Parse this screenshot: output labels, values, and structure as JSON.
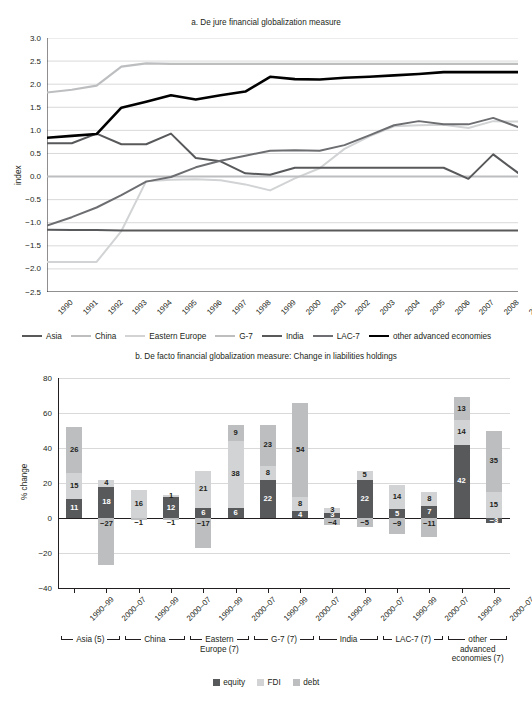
{
  "figure": {
    "panel_a_title": "a. De jure financial globalization measure",
    "panel_b_title": "b. De facto financial globalization measure: Change in liabilities holdings"
  },
  "chart_data": [
    {
      "type": "line",
      "title": "a. De jure financial globalization measure",
      "xlabel": "",
      "ylabel": "index",
      "ylim": [
        -2.5,
        3.0
      ],
      "yticks": [
        "-2.5",
        "-2.0",
        "-1.5",
        "-1.0",
        "-0.5",
        "0.0",
        "0.5",
        "1.0",
        "1.5",
        "2.0",
        "2.5",
        "3.0"
      ],
      "grid": true,
      "legend_position": "bottom",
      "x": [
        "1990",
        "1991",
        "1992",
        "1993",
        "1994",
        "1995",
        "1996",
        "1997",
        "1998",
        "1999",
        "2000",
        "2001",
        "2002",
        "2003",
        "2004",
        "2005",
        "2006",
        "2007",
        "2008",
        "2009"
      ],
      "series": [
        {
          "name": "Asia",
          "color": "#58595b",
          "width": 2.0,
          "values": [
            0.72,
            0.72,
            0.93,
            0.7,
            0.7,
            0.93,
            0.4,
            0.33,
            0.07,
            0.04,
            0.19,
            0.19,
            0.19,
            0.19,
            0.19,
            0.19,
            0.19,
            -0.05,
            0.48,
            0.08
          ]
        },
        {
          "name": "China",
          "color": "#bcbec0",
          "width": 2.0,
          "values": [
            0.0,
            0.0,
            0.0,
            0.0,
            0.0,
            0.0,
            0.0,
            0.0,
            0.0,
            0.0,
            0.0,
            0.0,
            0.0,
            0.0,
            0.0,
            0.0,
            0.0,
            0.0,
            0.0,
            0.0
          ]
        },
        {
          "name": "Eastern Europe",
          "color": "#d1d3d4",
          "width": 2.0,
          "values": [
            -1.85,
            -1.85,
            -1.85,
            -1.18,
            -0.1,
            -0.07,
            -0.06,
            -0.08,
            -0.17,
            -0.3,
            -0.04,
            0.18,
            0.6,
            0.87,
            1.09,
            1.11,
            1.12,
            1.05,
            1.2,
            1.19
          ]
        },
        {
          "name": "G-7",
          "color": "#bcbec0",
          "width": 2.2,
          "values": [
            1.82,
            1.88,
            1.97,
            2.38,
            2.45,
            2.44,
            2.44,
            2.44,
            2.44,
            2.44,
            2.44,
            2.44,
            2.44,
            2.44,
            2.44,
            2.44,
            2.44,
            2.44,
            2.44,
            2.44
          ]
        },
        {
          "name": "India",
          "color": "#58595b",
          "width": 2.0,
          "values": [
            -1.15,
            -1.16,
            -1.16,
            -1.17,
            -1.17,
            -1.17,
            -1.17,
            -1.17,
            -1.17,
            -1.17,
            -1.17,
            -1.17,
            -1.17,
            -1.17,
            -1.17,
            -1.17,
            -1.17,
            -1.17,
            -1.17,
            -1.17
          ]
        },
        {
          "name": "LAC-7",
          "color": "#6d6e71",
          "width": 2.0,
          "values": [
            -1.06,
            -0.88,
            -0.67,
            -0.4,
            -0.11,
            -0.01,
            0.2,
            0.34,
            0.45,
            0.56,
            0.57,
            0.56,
            0.68,
            0.89,
            1.11,
            1.2,
            1.13,
            1.13,
            1.27,
            1.07
          ]
        },
        {
          "name": "other advanced economies",
          "color": "#000000",
          "width": 2.6,
          "values": [
            0.84,
            0.88,
            0.92,
            1.49,
            1.62,
            1.76,
            1.67,
            1.76,
            1.84,
            2.16,
            2.11,
            2.1,
            2.14,
            2.16,
            2.19,
            2.22,
            2.26,
            2.26,
            2.26,
            2.26
          ]
        }
      ]
    },
    {
      "type": "bar",
      "subtype": "stacked",
      "title": "b. De facto financial globalization measure: Change in liabilities holdings",
      "xlabel": "",
      "ylabel": "% change",
      "ylim": [
        -40,
        80
      ],
      "yticks": [
        "-40",
        "-20",
        "0",
        "20",
        "40",
        "60",
        "80"
      ],
      "grid": true,
      "legend_position": "bottom",
      "components": [
        {
          "name": "equity",
          "color": "#58595b"
        },
        {
          "name": "FDI",
          "color": "#d1d3d4"
        },
        {
          "name": "debt",
          "color": "#bcbec0"
        }
      ],
      "groups": [
        {
          "name": "Asia (5)",
          "lines": [
            "Asia (5)"
          ]
        },
        {
          "name": "China",
          "lines": [
            "China"
          ]
        },
        {
          "name": "Eastern Europe (7)",
          "lines": [
            "Eastern",
            "Europe (7)"
          ]
        },
        {
          "name": "G-7 (7)",
          "lines": [
            "G-7 (7)"
          ]
        },
        {
          "name": "India",
          "lines": [
            "India"
          ]
        },
        {
          "name": "LAC-7 (7)",
          "lines": [
            "LAC-7 (7)"
          ]
        },
        {
          "name": "other advanced economies (7)",
          "lines": [
            "other",
            "advanced",
            "economies (7)"
          ]
        }
      ],
      "categories": [
        "1990–99",
        "2000–07",
        "1990–99",
        "2000–07",
        "1990–99",
        "2000–07",
        "1990–99",
        "2000–07",
        "1990–99",
        "2000–07",
        "1990–99",
        "2000–07",
        "1990–99",
        "2000–07"
      ],
      "bars": [
        {
          "group": "Asia (5)",
          "period": "1990–99",
          "equity": 11,
          "FDI": 15,
          "debt": 26
        },
        {
          "group": "Asia (5)",
          "period": "2000–07",
          "equity": 18,
          "FDI": 4,
          "debt": -27
        },
        {
          "group": "China",
          "period": "1990–99",
          "equity": null,
          "FDI": 16,
          "debt": -1
        },
        {
          "group": "China",
          "period": "2000–07",
          "equity": 12,
          "FDI": 1,
          "debt": -1
        },
        {
          "group": "Eastern Europe (7)",
          "period": "1990–99",
          "equity": 6,
          "FDI": 21,
          "debt": -17
        },
        {
          "group": "Eastern Europe (7)",
          "period": "2000–07",
          "equity": 6,
          "FDI": 38,
          "debt": 9
        },
        {
          "group": "G-7 (7)",
          "period": "1990–99",
          "equity": 22,
          "FDI": 8,
          "debt": 23
        },
        {
          "group": "G-7 (7)",
          "period": "2000–07",
          "equity": 4,
          "FDI": 8,
          "debt": 54
        },
        {
          "group": "India",
          "period": "1990–99",
          "equity": 3,
          "FDI": 3,
          "debt": -4
        },
        {
          "group": "India",
          "period": "2000–07",
          "equity": 22,
          "FDI": 5,
          "debt": -5
        },
        {
          "group": "LAC-7 (7)",
          "period": "1990–99",
          "equity": 5,
          "FDI": 14,
          "debt": -9
        },
        {
          "group": "LAC-7 (7)",
          "period": "2000–07",
          "equity": 7,
          "FDI": 8,
          "debt": -11
        },
        {
          "group": "other advanced economies (7)",
          "period": "1990–99",
          "equity": 42,
          "FDI": 14,
          "debt": 13
        },
        {
          "group": "other advanced economies (7)",
          "period": "2000–07",
          "equity": null,
          "FDI": 15,
          "debt": 35,
          "extra_neg": -3
        }
      ]
    }
  ]
}
